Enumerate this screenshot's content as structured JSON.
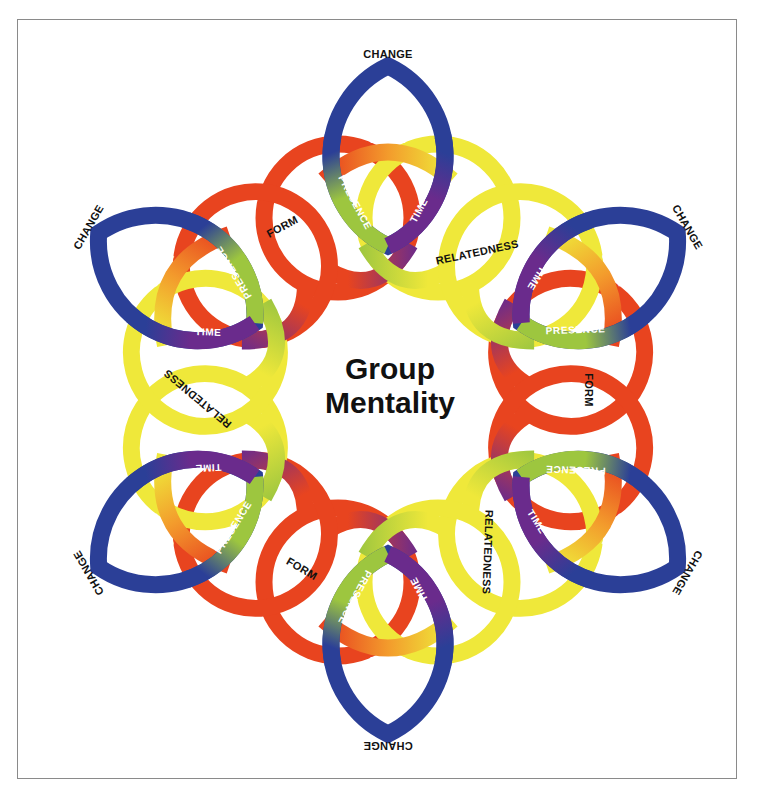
{
  "title": {
    "line1": "Group",
    "line2": "Mentality"
  },
  "colors": {
    "change": "#2b3f97",
    "form": "#e8441f",
    "relatedness": "#efe83a",
    "space": "#f39b2c",
    "presence": "#9dc63f",
    "time": "#6a2b8c",
    "frame": "#8a8a8a"
  },
  "labels": {
    "change": "CHANGE",
    "form": "FORM",
    "relatedness": "RELATEDNESS",
    "space": "SPACE",
    "presence": "PRESENCE",
    "time": "TIME"
  },
  "nodes": [
    {
      "id": "top",
      "angle": 0,
      "mirror": false,
      "outer_label": "CHANGE",
      "inner_labels": [
        "SPACE",
        "PRESENCE",
        "TIME"
      ]
    },
    {
      "id": "upper-right",
      "angle": 60,
      "mirror": true,
      "outer_label": "CHANGE",
      "inner_labels": [
        "SPACE",
        "PRESENCE",
        "TIME"
      ]
    },
    {
      "id": "lower-right",
      "angle": 120,
      "mirror": false,
      "outer_label": "CHANGE",
      "inner_labels": [
        "SPACE",
        "PRESENCE",
        "TIME"
      ]
    },
    {
      "id": "bottom",
      "angle": 180,
      "mirror": true,
      "outer_label": "CHANGE",
      "inner_labels": [
        "SPACE",
        "PRESENCE",
        "TIME"
      ]
    },
    {
      "id": "lower-left",
      "angle": 240,
      "mirror": false,
      "outer_label": "CHANGE",
      "inner_labels": [
        "SPACE",
        "PRESENCE",
        "TIME"
      ]
    },
    {
      "id": "upper-left",
      "angle": 300,
      "mirror": true,
      "outer_label": "CHANGE",
      "inner_labels": [
        "SPACE",
        "PRESENCE",
        "TIME"
      ]
    }
  ],
  "crossings": [
    {
      "id": "top-right",
      "label": "RELATEDNESS",
      "x": 478,
      "y": 256,
      "rotate": -12
    },
    {
      "id": "right",
      "label": "FORM",
      "x": 585,
      "y": 390,
      "rotate": 90
    },
    {
      "id": "bottom-right",
      "label": "RELATEDNESS",
      "x": 484,
      "y": 552,
      "rotate": 92
    },
    {
      "id": "bottom-left",
      "label": "FORM",
      "x": 300,
      "y": 572,
      "rotate": 30
    },
    {
      "id": "left",
      "label": "RELATEDNESS",
      "x": 200,
      "y": 396,
      "rotate": 220
    },
    {
      "id": "top-left",
      "label": "FORM",
      "x": 284,
      "y": 230,
      "rotate": -28
    }
  ]
}
